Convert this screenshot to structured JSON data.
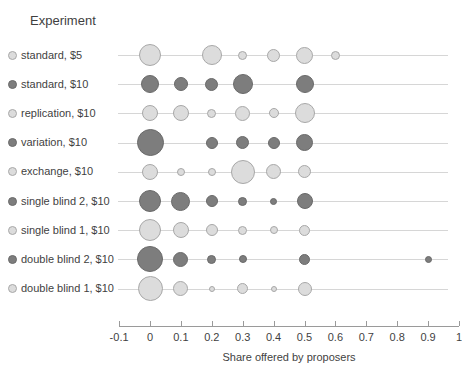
{
  "legend": {
    "title": "Experiment"
  },
  "colors": {
    "light_fill": "#dcdcdc",
    "light_stroke": "#a8a8a8",
    "dark_fill": "#7d7d7d",
    "dark_stroke": "#6a6a6a",
    "gridline": "#d6d6d6",
    "axis": "#9a9a9a",
    "text": "#3f3f3f"
  },
  "chart_data": {
    "type": "scatter",
    "title": "",
    "xlabel": "Share offered by proposers",
    "ylabel": "",
    "xlim": [
      -0.1,
      1
    ],
    "xticks": [
      -0.1,
      0,
      0.1,
      0.2,
      0.3,
      0.4,
      0.5,
      0.6,
      0.7,
      0.8,
      0.9,
      1
    ],
    "xtick_labels": [
      "-0.1",
      "0",
      "0.1",
      "0.2",
      "0.3",
      "0.4",
      "0.5",
      "0.6",
      "0.7",
      "0.8",
      "0.9",
      "1"
    ],
    "grid": true,
    "legend_position": "left",
    "size_encoding": "bubble area = relative frequency of offer",
    "series": [
      {
        "name": "standard, $5",
        "shade": "light",
        "points": [
          {
            "x": 0.0,
            "size": 22
          },
          {
            "x": 0.2,
            "size": 20
          },
          {
            "x": 0.3,
            "size": 9
          },
          {
            "x": 0.4,
            "size": 13
          },
          {
            "x": 0.5,
            "size": 17
          },
          {
            "x": 0.6,
            "size": 9
          }
        ]
      },
      {
        "name": "standard, $10",
        "shade": "dark",
        "points": [
          {
            "x": 0.0,
            "size": 18
          },
          {
            "x": 0.1,
            "size": 14
          },
          {
            "x": 0.2,
            "size": 13
          },
          {
            "x": 0.3,
            "size": 20
          },
          {
            "x": 0.5,
            "size": 18
          }
        ]
      },
      {
        "name": "replication, $10",
        "shade": "light",
        "points": [
          {
            "x": 0.0,
            "size": 16
          },
          {
            "x": 0.1,
            "size": 16
          },
          {
            "x": 0.2,
            "size": 9
          },
          {
            "x": 0.3,
            "size": 15
          },
          {
            "x": 0.4,
            "size": 10
          },
          {
            "x": 0.5,
            "size": 20
          }
        ]
      },
      {
        "name": "variation, $10",
        "shade": "dark",
        "points": [
          {
            "x": 0.0,
            "size": 27
          },
          {
            "x": 0.2,
            "size": 12
          },
          {
            "x": 0.3,
            "size": 13
          },
          {
            "x": 0.4,
            "size": 12
          },
          {
            "x": 0.5,
            "size": 17
          }
        ]
      },
      {
        "name": "exchange, $10",
        "shade": "light",
        "points": [
          {
            "x": 0.0,
            "size": 16
          },
          {
            "x": 0.1,
            "size": 8
          },
          {
            "x": 0.2,
            "size": 8
          },
          {
            "x": 0.3,
            "size": 24
          },
          {
            "x": 0.4,
            "size": 15
          },
          {
            "x": 0.5,
            "size": 13
          }
        ]
      },
      {
        "name": "single blind 2, $10",
        "shade": "dark",
        "points": [
          {
            "x": 0.0,
            "size": 22
          },
          {
            "x": 0.1,
            "size": 19
          },
          {
            "x": 0.2,
            "size": 12
          },
          {
            "x": 0.3,
            "size": 9
          },
          {
            "x": 0.4,
            "size": 7
          },
          {
            "x": 0.5,
            "size": 16
          }
        ]
      },
      {
        "name": "single blind 1, $10",
        "shade": "light",
        "points": [
          {
            "x": 0.0,
            "size": 22
          },
          {
            "x": 0.1,
            "size": 16
          },
          {
            "x": 0.2,
            "size": 12
          },
          {
            "x": 0.3,
            "size": 9
          },
          {
            "x": 0.4,
            "size": 8
          },
          {
            "x": 0.5,
            "size": 11
          }
        ]
      },
      {
        "name": "double blind 2, $10",
        "shade": "dark",
        "points": [
          {
            "x": 0.0,
            "size": 26
          },
          {
            "x": 0.1,
            "size": 15
          },
          {
            "x": 0.2,
            "size": 9
          },
          {
            "x": 0.3,
            "size": 8
          },
          {
            "x": 0.5,
            "size": 11
          },
          {
            "x": 0.9,
            "size": 7
          }
        ]
      },
      {
        "name": "double blind 1, $10",
        "shade": "light",
        "points": [
          {
            "x": 0.0,
            "size": 25
          },
          {
            "x": 0.1,
            "size": 15
          },
          {
            "x": 0.2,
            "size": 6
          },
          {
            "x": 0.3,
            "size": 11
          },
          {
            "x": 0.4,
            "size": 6
          },
          {
            "x": 0.5,
            "size": 14
          }
        ]
      }
    ]
  }
}
